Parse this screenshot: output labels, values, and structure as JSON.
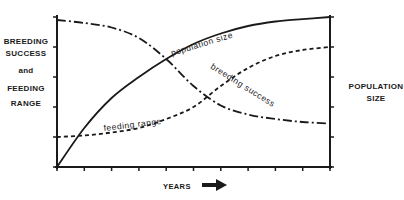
{
  "chart_data": {
    "type": "line",
    "title": "",
    "xlabel": "YEARS",
    "ylabel_left": "BREEDING SUCCESS and FEEDING RANGE",
    "ylabel_right": "POPULATION SIZE",
    "x": [
      0,
      1,
      2,
      3,
      4,
      5,
      6,
      7,
      8,
      9,
      10
    ],
    "xlim": [
      0,
      10
    ],
    "ylim": [
      0,
      5
    ],
    "grid": false,
    "legend": "inline labels",
    "series": [
      {
        "name": "population size",
        "style": "solid",
        "values": [
          0.0,
          1.3,
          2.3,
          3.0,
          3.6,
          4.1,
          4.45,
          4.7,
          4.85,
          4.93,
          5.0
        ]
      },
      {
        "name": "breeding success",
        "style": "dash-dot",
        "values": [
          4.9,
          4.8,
          4.65,
          4.3,
          3.6,
          2.7,
          2.05,
          1.75,
          1.6,
          1.5,
          1.45
        ]
      },
      {
        "name": "feeding range",
        "style": "dashed",
        "values": [
          1.0,
          1.05,
          1.15,
          1.3,
          1.6,
          2.0,
          2.7,
          3.3,
          3.7,
          3.9,
          4.0
        ]
      }
    ]
  },
  "labels": {
    "left": [
      "BREEDING",
      "SUCCESS",
      "and",
      "FEEDING",
      "RANGE"
    ],
    "right": [
      "POPULATION",
      "SIZE"
    ],
    "x": "YEARS",
    "x_arrow": "arrow-right-icon"
  },
  "colors": {
    "ink": "#1a1a1a",
    "background": "#ffffff"
  }
}
